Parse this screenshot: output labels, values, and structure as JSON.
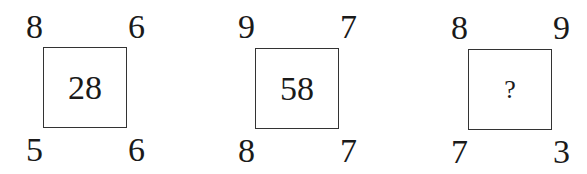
{
  "puzzle": {
    "squares": [
      {
        "top_left": "8",
        "top_right": "6",
        "bottom_left": "5",
        "bottom_right": "6",
        "center": "28"
      },
      {
        "top_left": "9",
        "top_right": "7",
        "bottom_left": "8",
        "bottom_right": "7",
        "center": "58"
      },
      {
        "top_left": "8",
        "top_right": "9",
        "bottom_left": "7",
        "bottom_right": "3",
        "center": "?"
      }
    ]
  }
}
